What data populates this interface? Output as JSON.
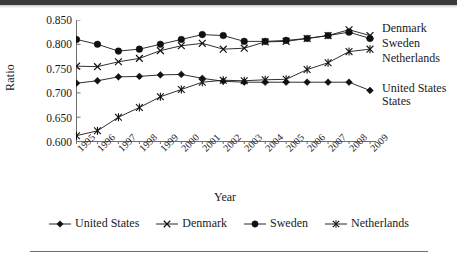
{
  "chart_data": {
    "type": "line",
    "title": "",
    "xlabel": "Year",
    "ylabel": "Ratio",
    "grid": false,
    "legend_position": "bottom",
    "categories": [
      "1995",
      "1996",
      "1997",
      "1998",
      "1999",
      "2000",
      "2001",
      "2002",
      "2003",
      "2004",
      "2005",
      "2006",
      "2007",
      "2008",
      "2009"
    ],
    "x": [
      1995,
      1996,
      1997,
      1998,
      1999,
      2000,
      2001,
      2002,
      2003,
      2004,
      2005,
      2006,
      2007,
      2008,
      2009
    ],
    "xlim": [
      1995,
      2009
    ],
    "ylim": [
      0.6,
      0.85
    ],
    "yticks": [
      "0.600",
      "0.650",
      "0.700",
      "0.750",
      "0.800",
      "0.850"
    ],
    "ytick_values": [
      0.6,
      0.65,
      0.7,
      0.75,
      0.8,
      0.85
    ],
    "series": [
      {
        "name": "United States",
        "marker": "diamond",
        "values": [
          0.72,
          0.725,
          0.733,
          0.734,
          0.737,
          0.738,
          0.73,
          0.724,
          0.722,
          0.722,
          0.722,
          0.722,
          0.722,
          0.722,
          0.705
        ]
      },
      {
        "name": "Denmark",
        "marker": "x",
        "values": [
          0.755,
          0.754,
          0.764,
          0.771,
          0.787,
          0.797,
          0.802,
          0.79,
          0.792,
          0.805,
          0.806,
          0.812,
          0.818,
          0.83,
          0.818
        ]
      },
      {
        "name": "Sweden",
        "marker": "circle",
        "values": [
          0.81,
          0.8,
          0.786,
          0.79,
          0.8,
          0.81,
          0.82,
          0.818,
          0.806,
          0.806,
          0.808,
          0.812,
          0.818,
          0.825,
          0.812
        ]
      },
      {
        "name": "Netherlands",
        "marker": "asterisk",
        "values": [
          0.612,
          0.622,
          0.65,
          0.67,
          0.692,
          0.707,
          0.722,
          0.726,
          0.725,
          0.727,
          0.728,
          0.748,
          0.762,
          0.785,
          0.79
        ]
      }
    ],
    "endpoint_labels": [
      "Denmark",
      "Sweden",
      "Netherlands",
      "United States"
    ],
    "legend_entries": [
      "United States",
      "Denmark",
      "Sweden",
      "Netherlands"
    ],
    "colors": {
      "line": "#1a1a1a",
      "axis": "#6e6e6e",
      "text": "#1a1a1a",
      "background": "#ffffff"
    }
  }
}
